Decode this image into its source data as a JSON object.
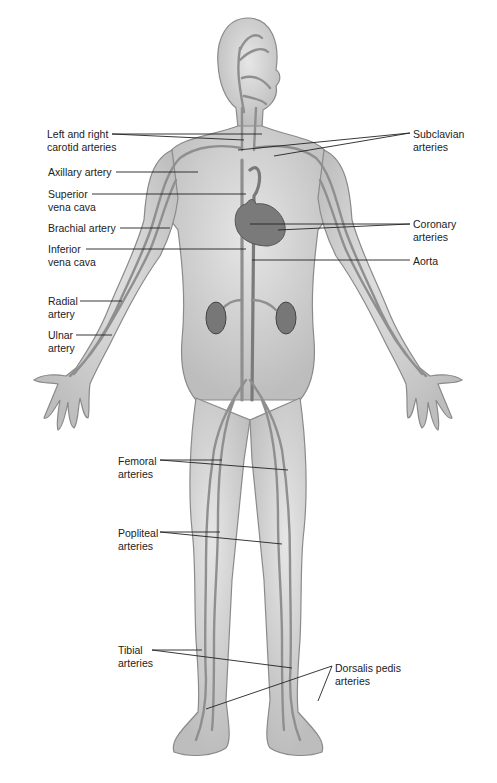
{
  "diagram": {
    "labels_left": [
      {
        "id": "carotid",
        "lines": [
          "Left and right",
          "carotid arteries"
        ],
        "x": 47,
        "y": 128
      },
      {
        "id": "axillary",
        "lines": [
          "Axillary artery"
        ],
        "x": 48,
        "y": 166
      },
      {
        "id": "svc",
        "lines": [
          "Superior",
          "vena cava"
        ],
        "x": 48,
        "y": 188
      },
      {
        "id": "brachial",
        "lines": [
          "Brachial artery"
        ],
        "x": 48,
        "y": 222
      },
      {
        "id": "ivc",
        "lines": [
          "Inferior",
          "vena cava"
        ],
        "x": 48,
        "y": 243
      },
      {
        "id": "radial",
        "lines": [
          "Radial",
          "artery"
        ],
        "x": 48,
        "y": 295
      },
      {
        "id": "ulnar",
        "lines": [
          "Ulnar",
          "artery"
        ],
        "x": 48,
        "y": 329
      },
      {
        "id": "femoral",
        "lines": [
          "Femoral",
          "arteries"
        ],
        "x": 118,
        "y": 455
      },
      {
        "id": "popliteal",
        "lines": [
          "Popliteal",
          "arteries"
        ],
        "x": 118,
        "y": 527
      },
      {
        "id": "tibial",
        "lines": [
          "Tibial",
          "arteries"
        ],
        "x": 118,
        "y": 644
      }
    ],
    "labels_right": [
      {
        "id": "subclavian",
        "lines": [
          "Subclavian",
          "arteries"
        ],
        "x": 413,
        "y": 128
      },
      {
        "id": "coronary",
        "lines": [
          "Coronary",
          "arteries"
        ],
        "x": 413,
        "y": 218
      },
      {
        "id": "aorta",
        "lines": [
          "Aorta"
        ],
        "x": 413,
        "y": 255
      },
      {
        "id": "dorsalis",
        "lines": [
          "Dorsalis pedis",
          "arteries"
        ],
        "x": 335,
        "y": 670
      }
    ],
    "colors": {
      "body_fill": "#d4d4d4",
      "body_outline": "#8a8a8a",
      "vessel": "#8f8f8f",
      "vessel_dark": "#6e6e6e",
      "heart": "#7a7a7a",
      "kidney": "#777777",
      "leader": "#222222",
      "text": "#222222"
    }
  }
}
